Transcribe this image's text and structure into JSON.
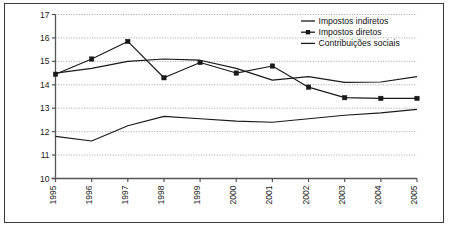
{
  "chart_data": {
    "type": "line",
    "title": "",
    "subtitle": "",
    "xlabel": "",
    "ylabel": "",
    "categories": [
      "1995",
      "1996",
      "1997",
      "1998",
      "1999",
      "2000",
      "2001",
      "2002",
      "2003",
      "2004",
      "2005"
    ],
    "x_tick_labels": [
      "1995",
      "1996",
      "1997",
      "1998",
      "1999",
      "2000",
      "2001",
      "2002",
      "2003",
      "2004",
      "2005"
    ],
    "x_tick_rotation": -90,
    "y_tick_labels": [
      "10",
      "11",
      "12",
      "13",
      "14",
      "15",
      "16",
      "17"
    ],
    "y_ticks": [
      10,
      11,
      12,
      13,
      14,
      15,
      16,
      17
    ],
    "ylim": [
      10,
      17
    ],
    "grid": "horizontal-dotted",
    "legend_position": "top-right",
    "series": [
      {
        "name": "Impostos indiretos",
        "marker": "none",
        "color": "#1a1a1a",
        "values": [
          14.5,
          14.7,
          15.0,
          15.1,
          15.05,
          14.7,
          14.2,
          14.35,
          14.1,
          14.12,
          14.35
        ]
      },
      {
        "name": "Impostos diretos",
        "marker": "square",
        "color": "#1a1a1a",
        "values": [
          14.45,
          15.1,
          15.85,
          14.3,
          14.95,
          14.5,
          14.8,
          13.9,
          13.45,
          13.42,
          13.42
        ]
      },
      {
        "name": "Contribuições sociais",
        "marker": "none",
        "color": "#1a1a1a",
        "values": [
          11.8,
          11.6,
          12.25,
          12.65,
          12.55,
          12.45,
          12.4,
          12.55,
          12.7,
          12.8,
          12.95
        ]
      }
    ]
  },
  "legend": {
    "items": [
      {
        "label": "Impostos indiretos",
        "marker": "line"
      },
      {
        "label": "Impostos diretos",
        "marker": "line-square"
      },
      {
        "label": "Contribuições sociais",
        "marker": "line"
      }
    ]
  },
  "colors": {
    "frame": "#3a3a3a",
    "axis": "#555555",
    "grid": "#9a9a9a",
    "series": "#1a1a1a",
    "background": "#ffffff"
  }
}
